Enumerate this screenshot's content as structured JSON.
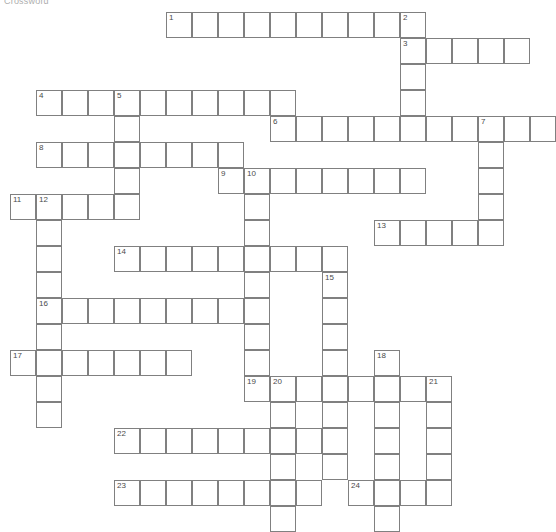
{
  "page": {
    "title_fragment": "Crossword",
    "width": 538,
    "height": 530,
    "background_color": "#ffffff"
  },
  "grid": {
    "cell_size": 26,
    "origin_x": 10,
    "origin_y": 12,
    "border_color": "#808080",
    "cell_fill": "#ffffff",
    "number_color": "#4a4a4a",
    "columns": 20,
    "rows": 20
  },
  "entries": [
    {
      "number": 1,
      "direction": "across",
      "col": 6,
      "row": 0,
      "length": 9
    },
    {
      "number": 2,
      "direction": "down",
      "col": 15,
      "row": 0,
      "length": 4
    },
    {
      "number": 3,
      "direction": "across",
      "col": 15,
      "row": 1,
      "length": 5
    },
    {
      "number": 4,
      "direction": "across",
      "col": 1,
      "row": 3,
      "length": 10
    },
    {
      "number": 5,
      "direction": "down",
      "col": 4,
      "row": 3,
      "length": 5
    },
    {
      "number": 6,
      "direction": "across",
      "col": 10,
      "row": 4,
      "length": 11
    },
    {
      "number": 7,
      "direction": "down",
      "col": 18,
      "row": 4,
      "length": 5
    },
    {
      "number": 8,
      "direction": "across",
      "col": 1,
      "row": 5,
      "length": 8
    },
    {
      "number": 9,
      "direction": "across",
      "col": 8,
      "row": 6,
      "length": 8
    },
    {
      "number": 10,
      "direction": "down",
      "col": 9,
      "row": 6,
      "length": 8
    },
    {
      "number": 11,
      "direction": "across",
      "col": 0,
      "row": 7,
      "length": 5
    },
    {
      "number": 12,
      "direction": "down",
      "col": 1,
      "row": 7,
      "length": 9
    },
    {
      "number": 13,
      "direction": "across",
      "col": 14,
      "row": 8,
      "length": 5
    },
    {
      "number": 14,
      "direction": "across",
      "col": 4,
      "row": 9,
      "length": 9
    },
    {
      "number": 15,
      "direction": "down",
      "col": 12,
      "row": 10,
      "length": 8
    },
    {
      "number": 16,
      "direction": "across",
      "col": 1,
      "row": 11,
      "length": 9
    },
    {
      "number": 17,
      "direction": "across",
      "col": 0,
      "row": 13,
      "length": 7
    },
    {
      "number": 18,
      "direction": "down",
      "col": 14,
      "row": 13,
      "length": 7
    },
    {
      "number": 19,
      "direction": "across",
      "col": 9,
      "row": 14,
      "length": 7
    },
    {
      "number": 20,
      "direction": "down",
      "col": 10,
      "row": 14,
      "length": 6
    },
    {
      "number": 21,
      "direction": "down",
      "col": 16,
      "row": 14,
      "length": 5
    },
    {
      "number": 22,
      "direction": "across",
      "col": 4,
      "row": 16,
      "length": 8
    },
    {
      "number": 23,
      "direction": "across",
      "col": 4,
      "row": 18,
      "length": 8
    },
    {
      "number": 24,
      "direction": "across",
      "col": 13,
      "row": 18,
      "length": 4
    }
  ],
  "numbered_cells": [
    {
      "number": 1,
      "col": 6,
      "row": 0
    },
    {
      "number": 2,
      "col": 15,
      "row": 0
    },
    {
      "number": 3,
      "col": 15,
      "row": 1
    },
    {
      "number": 4,
      "col": 1,
      "row": 3
    },
    {
      "number": 5,
      "col": 4,
      "row": 3
    },
    {
      "number": 6,
      "col": 10,
      "row": 4
    },
    {
      "number": 7,
      "col": 18,
      "row": 4
    },
    {
      "number": 8,
      "col": 1,
      "row": 5
    },
    {
      "number": 9,
      "col": 8,
      "row": 6
    },
    {
      "number": 10,
      "col": 9,
      "row": 6
    },
    {
      "number": 11,
      "col": 0,
      "row": 7
    },
    {
      "number": 12,
      "col": 1,
      "row": 7
    },
    {
      "number": 13,
      "col": 14,
      "row": 8
    },
    {
      "number": 14,
      "col": 4,
      "row": 9
    },
    {
      "number": 15,
      "col": 12,
      "row": 10
    },
    {
      "number": 16,
      "col": 1,
      "row": 11
    },
    {
      "number": 17,
      "col": 0,
      "row": 13
    },
    {
      "number": 18,
      "col": 14,
      "row": 13
    },
    {
      "number": 19,
      "col": 9,
      "row": 14
    },
    {
      "number": 20,
      "col": 10,
      "row": 14
    },
    {
      "number": 21,
      "col": 16,
      "row": 14
    },
    {
      "number": 22,
      "col": 4,
      "row": 16
    },
    {
      "number": 23,
      "col": 4,
      "row": 18
    },
    {
      "number": 24,
      "col": 13,
      "row": 18
    }
  ],
  "letters": {}
}
